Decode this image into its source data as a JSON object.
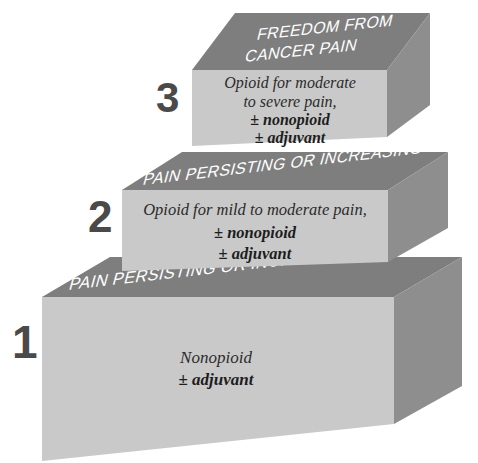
{
  "diagram": {
    "background_color": "#ffffff",
    "colors": {
      "front_face": "#c9c9c9",
      "side_face": "#8e8e8e",
      "top_face": "#7e7e7e",
      "banner_text": "#ffffff",
      "body_text": "#2b2b2b",
      "step_number": "#4a4a4a"
    }
  },
  "steps": [
    {
      "number": "1",
      "top_banner": "PAIN PERSISTING OR INCREASING",
      "body_lines": [
        {
          "text": "Nonopioid",
          "bold": false
        },
        {
          "text": "± adjuvant",
          "bold": true
        }
      ]
    },
    {
      "number": "2",
      "top_banner": "PAIN PERSISTING OR INCREASING",
      "body_lines": [
        {
          "text": "Opioid for mild to moderate pain,",
          "bold": false
        },
        {
          "text": "± nonopioid",
          "bold": true
        },
        {
          "text": "± adjuvant",
          "bold": true
        }
      ]
    },
    {
      "number": "3",
      "top_banner_lines": [
        "FREEDOM FROM",
        "CANCER PAIN"
      ],
      "body_lines": [
        {
          "text": "Opioid for moderate",
          "bold": false
        },
        {
          "text": "to severe pain,",
          "bold": false
        },
        {
          "text": "± nonopioid",
          "bold": true
        },
        {
          "text": "± adjuvant",
          "bold": true
        }
      ]
    }
  ]
}
